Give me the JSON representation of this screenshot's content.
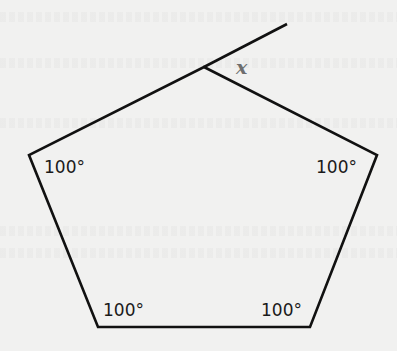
{
  "diagram": {
    "type": "pentagon-exterior-angle",
    "stroke_color": "#111111",
    "background_color": "#f1f1f0",
    "vertices": {
      "top": [
        204,
        67
      ],
      "right": [
        377,
        155
      ],
      "bottom_right": [
        310,
        327
      ],
      "bottom_left": [
        98,
        327
      ],
      "left": [
        29,
        155
      ]
    },
    "extension_end": [
      287,
      24
    ],
    "angle_labels": {
      "left": "100°",
      "right": "100°",
      "bottom_left": "100°",
      "bottom_right": "100°"
    },
    "unknown_label": "x",
    "unknown_color": "#6e6e6e"
  }
}
